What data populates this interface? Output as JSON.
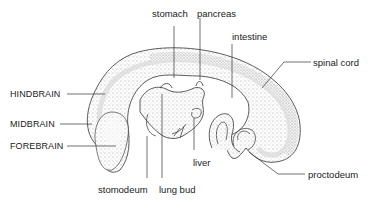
{
  "diagram": {
    "labels": {
      "stomach": "stomach",
      "pancreas": "pancreas",
      "intestine": "intestine",
      "spinal_cord": "spinal cord",
      "hindbrain": "HINDBRAIN",
      "midbrain": "MIDBRAIN",
      "forebrain": "FOREBRAIN",
      "liver": "liver",
      "stomodeum": "stomodeum",
      "lung_bud": "lung bud",
      "proctodeum": "proctodeum"
    },
    "colors": {
      "line": "#333333",
      "stipple": "#bdbdbd",
      "text": "#222222",
      "background": "#ffffff"
    }
  }
}
